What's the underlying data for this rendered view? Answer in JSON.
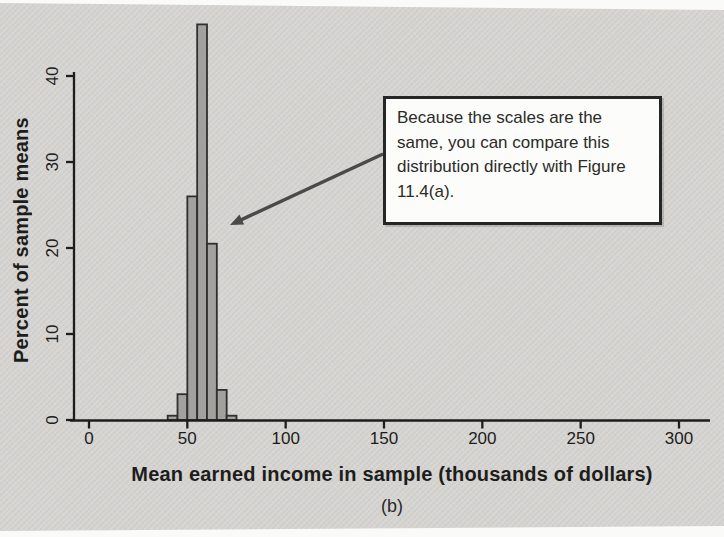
{
  "figure": {
    "caption": "(b)",
    "background_color": "#d6d5d2",
    "annotation": {
      "text": "Because the scales are the same, you can compare this distribution directly with Figure 11.4(a).",
      "border_color": "#262626",
      "bg_color": "#fcfcfa"
    },
    "arrow_color": "#4a4a48"
  },
  "chart_data": {
    "type": "bar",
    "title": "",
    "xlabel": "Mean earned income in sample (thousands of dollars)",
    "ylabel": "Percent of sample means",
    "x_ticks": [
      0,
      50,
      100,
      150,
      200,
      250,
      300
    ],
    "y_ticks": [
      0,
      10,
      20,
      30,
      40
    ],
    "xlim": [
      0,
      315
    ],
    "ylim": [
      0,
      46
    ],
    "grid": false,
    "legend": null,
    "bin_width": 5,
    "bin_start": [
      40,
      45,
      50,
      55,
      60,
      65,
      70
    ],
    "values": [
      0.5,
      3,
      26,
      46,
      20.5,
      3.5,
      0.5
    ],
    "bar_fill": "#a2a19e",
    "bar_edge": "#2f2f2d",
    "axis_color": "#1d1d1b"
  }
}
